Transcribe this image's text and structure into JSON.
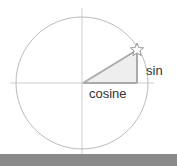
{
  "diagram": {
    "labels": {
      "sin": "sin",
      "cosine": "cosine"
    },
    "colors": {
      "circle": "#bbbbbb",
      "axes": "#cccccc",
      "triangle_fill": "#eeeeee",
      "triangle_stroke": "#aaaaaa",
      "bottom_bar": "#8a8a8a"
    },
    "icons": {
      "point_marker": "star-icon"
    }
  }
}
